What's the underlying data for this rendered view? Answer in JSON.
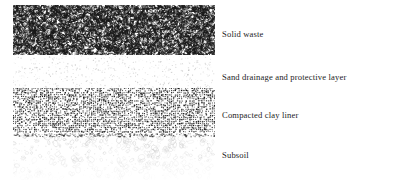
{
  "figure": {
    "type": "cross-section-diagram",
    "title": "",
    "background_color": "#ffffff",
    "width": 397,
    "height": 182
  },
  "layers": [
    {
      "id": "solid-waste",
      "label": "Solid waste",
      "pattern": "irregular-dashes",
      "pattern_color": "#1a1a1a",
      "density": "dense",
      "top": 5,
      "height": 50,
      "label_y": 30
    },
    {
      "id": "sand-drainage",
      "label": "Sand drainage and protective layer",
      "pattern": "fine-stipple",
      "pattern_color": "#b9b9b9",
      "density": "sparse",
      "top": 55,
      "height": 33,
      "label_y": 73
    },
    {
      "id": "compacted-clay-liner",
      "label": "Compacted clay liner",
      "pattern": "dense-squares",
      "pattern_color": "#111111",
      "density": "very-dense",
      "top": 88,
      "height": 45,
      "label_y": 111
    },
    {
      "id": "subsoil",
      "label": "Subsoil",
      "pattern": "outlined-ellipses",
      "pattern_color": "#c2c2c2",
      "density": "sparse",
      "top": 133,
      "height": 47,
      "label_y": 151
    }
  ]
}
